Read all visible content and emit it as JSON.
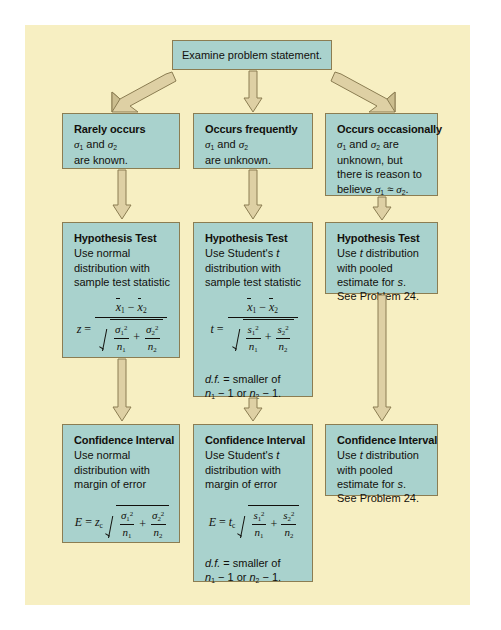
{
  "diagram": {
    "colors": {
      "panel_background": "#f7efc2",
      "box_fill": "#a9d2cd",
      "box_border": "#8b7d52",
      "arrow_fill": "#ded0a4",
      "arrow_edge": "#8b7d52",
      "text": "#12100c"
    }
  },
  "start": {
    "label": "Examine problem statement."
  },
  "conditions": [
    {
      "header": "Rarely occurs",
      "lines": [
        "σ₁ and σ₂",
        "are known."
      ]
    },
    {
      "header": "Occurs frequently",
      "lines": [
        "σ₁ and σ₂",
        "are unknown."
      ]
    },
    {
      "header": "Occurs occasionally",
      "lines": [
        "σ₁ and σ₂ are",
        "unknown, but",
        "there is reason to",
        "believe σ₁ ≈ σ₂."
      ]
    }
  ],
  "hypothesis_tests": [
    {
      "header": "Hypothesis Test",
      "lines": [
        "Use normal",
        "distribution with",
        "sample test statistic"
      ],
      "formula": "z = (x̅1 − x̅2) / √(σ₁²/n₁ + σ₂²/n₂)",
      "note": ""
    },
    {
      "header": "Hypothesis Test",
      "lines": [
        "Use Student's t",
        "distribution with",
        "sample test statistic"
      ],
      "formula": "t = (x̅1 − x̅2) / √(s₁²/n₁ + s₂²/n₂)",
      "note_lines": [
        "d.f. = smaller of",
        "n₁ − 1 or n₂ − 1."
      ]
    },
    {
      "header": "Hypothesis Test",
      "lines": [
        "Use t distribution",
        "with pooled",
        "estimate for s.",
        "See Problem 24."
      ],
      "formula": "",
      "note": ""
    }
  ],
  "confidence_intervals": [
    {
      "header": "Confidence Interval",
      "lines": [
        "Use normal",
        "distribution with",
        "margin of error"
      ],
      "formula": "E = z_c √(σ₁²/n₁ + σ₂²/n₂)",
      "note": ""
    },
    {
      "header": "Confidence Interval",
      "lines": [
        "Use Student's t",
        "distribution with",
        "margin of error"
      ],
      "formula": "E = t_c √(s₁²/n₁ + s₂²/n₂)",
      "note_lines": [
        "d.f. = smaller of",
        "n₁ − 1 or n₂ − 1."
      ]
    },
    {
      "header": "Confidence Interval",
      "lines": [
        "Use t distribution",
        "with pooled",
        "estimate for s.",
        "See Problem 24."
      ],
      "formula": "",
      "note": ""
    }
  ],
  "arrows": {
    "from_start": [
      "diagonal-left",
      "straight-down",
      "diagonal-right"
    ],
    "to_hypothesis": [
      "down",
      "down",
      "down"
    ],
    "to_confidence": [
      "down",
      "down",
      "long-down"
    ]
  }
}
